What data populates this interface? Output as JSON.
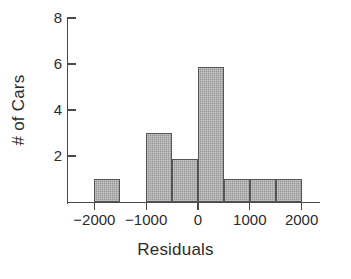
{
  "chart_data": {
    "type": "bar",
    "title": "",
    "xlabel": "Residuals",
    "ylabel": "# of Cars",
    "xlim": [
      -2250,
      -2250
    ],
    "ylim": [
      0,
      8
    ],
    "grid": false,
    "legend": null,
    "bin_width": 500,
    "bins": [
      {
        "label": "-2000 to -1500",
        "left": -2000,
        "right": -1500,
        "value": 1
      },
      {
        "label": "-1000 to -500",
        "left": -1000,
        "right": -500,
        "value": 3
      },
      {
        "label": "-500 to 0",
        "left": -500,
        "right": 0,
        "value": 1.85
      },
      {
        "label": "0 to 500",
        "left": 0,
        "right": 500,
        "value": 5.85
      },
      {
        "label": "500 to 1000",
        "left": 500,
        "right": 1000,
        "value": 1
      },
      {
        "label": "1000 to 1500",
        "left": 1000,
        "right": 1500,
        "value": 1
      },
      {
        "label": "1500 to 2000",
        "left": 1500,
        "right": 2000,
        "value": 1
      }
    ],
    "xticks": [
      -2000,
      -1000,
      0,
      1000,
      2000
    ],
    "xtick_labels": [
      "−2000",
      "−1000",
      "0",
      "1000",
      "2000"
    ],
    "yticks": [
      2,
      4,
      6,
      8
    ],
    "ytick_labels": [
      "2",
      "4",
      "6",
      "8"
    ],
    "colors": {
      "bar_fill": "#a9a9a9",
      "bar_edge": "#555555",
      "axis": "#4a4a4a",
      "text": "#2b2b2b",
      "background": "#ffffff"
    }
  }
}
